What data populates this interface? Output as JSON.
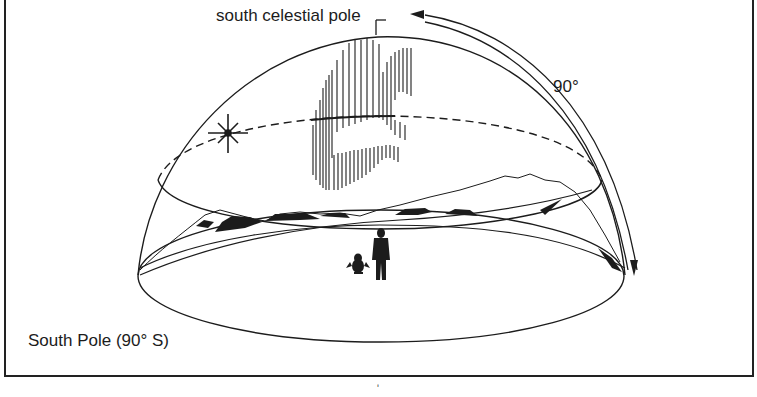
{
  "diagram": {
    "labels": {
      "celestial_pole": "south celestial pole",
      "angle": "90°",
      "location": "South Pole (90° S)",
      "stray_mark": "ʹ"
    },
    "elements": {
      "dome": "celestial-hemisphere",
      "horizon": "horizon-ellipse",
      "sun_path": "daily-sun-path-parallel-to-horizon",
      "sun_path_direction": "arrowhead-counterclockwise",
      "aurora": "aurora-australis-curtain",
      "star": "sun-star-glyph",
      "figures": [
        "penguin",
        "person"
      ],
      "mountains": "horizon-mountain-silhouettes",
      "altitude_arc": "arc-from-horizon-to-pole-90-degrees"
    },
    "colors": {
      "ink": "#1c1c1c",
      "background": "#ffffff"
    }
  }
}
